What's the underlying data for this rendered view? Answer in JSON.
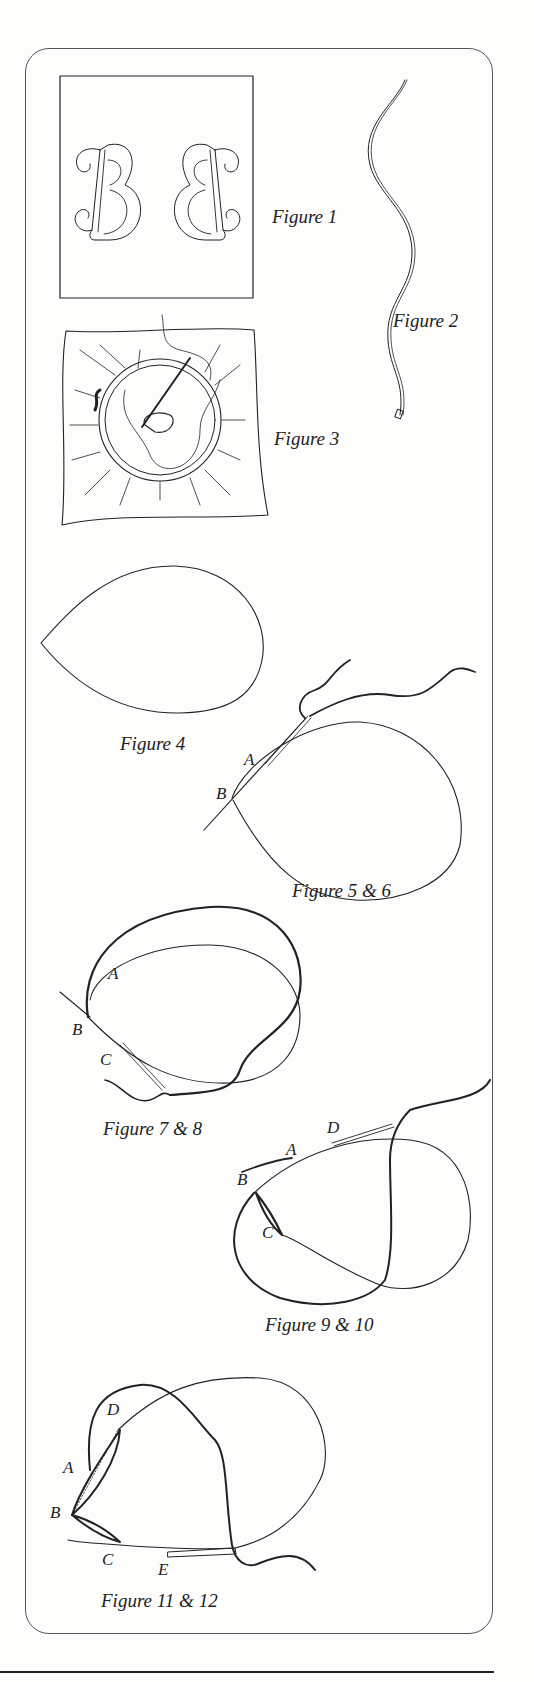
{
  "page": {
    "figures": [
      {
        "id": "fig1",
        "caption": "Figure 1"
      },
      {
        "id": "fig2",
        "caption": "Figure 2"
      },
      {
        "id": "fig3",
        "caption": "Figure 3"
      },
      {
        "id": "fig4",
        "caption": "Figure 4"
      },
      {
        "id": "fig5_6",
        "caption": "Figure 5 & 6",
        "labels": [
          "A",
          "B"
        ]
      },
      {
        "id": "fig7_8",
        "caption": "Figure 7 & 8",
        "labels": [
          "A",
          "B",
          "C"
        ]
      },
      {
        "id": "fig9_10",
        "caption": "Figure 9 & 10",
        "labels": [
          "D",
          "A",
          "B",
          "C"
        ]
      },
      {
        "id": "fig11_12",
        "caption": "Figure 11 & 12",
        "labels": [
          "D",
          "A",
          "B",
          "C",
          "E"
        ]
      }
    ]
  }
}
